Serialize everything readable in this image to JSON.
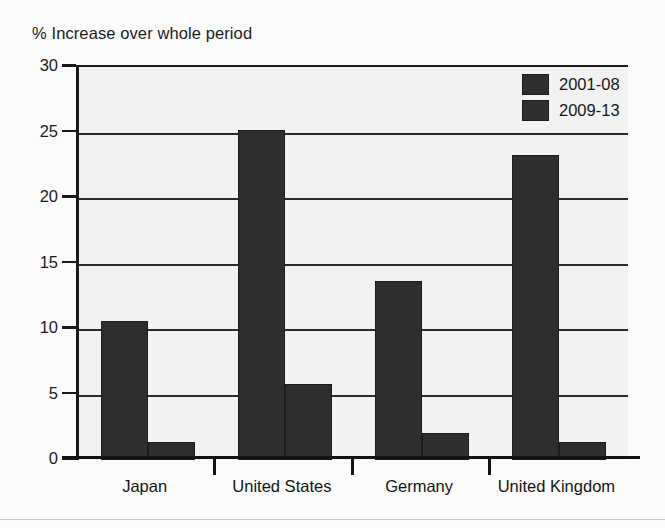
{
  "chart_data": {
    "type": "bar",
    "title": "% Increase over whole period",
    "xlabel": "",
    "ylabel": "",
    "ylim": [
      0,
      30
    ],
    "ytick_labels": [
      "30",
      "25",
      "20",
      "15",
      "10",
      "5",
      "0"
    ],
    "yticks": [
      30,
      25,
      20,
      15,
      10,
      5,
      0
    ],
    "grid": true,
    "legend_position": "top-right",
    "categories": [
      "Japan",
      "United States",
      "Germany",
      "United Kingdom"
    ],
    "series": [
      {
        "name": "2001-08",
        "color": "#2e2e2e",
        "values": [
          10.6,
          25.2,
          13.7,
          23.3
        ]
      },
      {
        "name": "2009-13",
        "color": "#2e2e2e",
        "values": [
          1.4,
          5.8,
          2.1,
          1.4
        ]
      }
    ]
  },
  "legend": {
    "entries": [
      {
        "label": "2001-08"
      },
      {
        "label": "2009-13"
      }
    ]
  },
  "colors": {
    "bar": "#2e2e2e",
    "plot_background": "#f2f2f2",
    "page_background": "#fbfbfb",
    "axis": "#1a1a1a",
    "text": "#1b1b1b"
  }
}
